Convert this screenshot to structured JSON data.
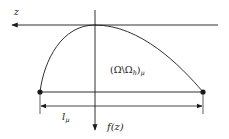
{
  "diagram": {
    "labels": {
      "z_axis": "z",
      "region": "(Ω\\Ωh)μ",
      "region_parts": {
        "open": "(Ω\\Ω",
        "sub_h": "h",
        "close": ")",
        "sub_mu": "μ"
      },
      "length": "l",
      "length_sub": "μ",
      "f_axis": "f(z)"
    },
    "colors": {
      "stroke": "#1a1a1a",
      "background": "#ffffff"
    }
  }
}
